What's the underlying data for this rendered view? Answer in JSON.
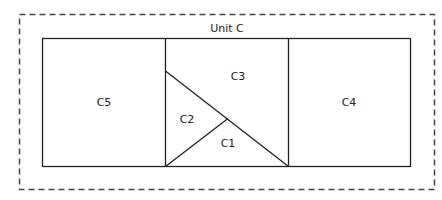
{
  "diagram": {
    "title": "Unit C",
    "colors": {
      "line": "#222222",
      "dashed": "#444444",
      "background": "#ffffff"
    },
    "regions": [
      {
        "id": "C5",
        "label": "C5"
      },
      {
        "id": "C3",
        "label": "C3"
      },
      {
        "id": "C2",
        "label": "C2"
      },
      {
        "id": "C1",
        "label": "C1"
      },
      {
        "id": "C4",
        "label": "C4"
      }
    ]
  }
}
